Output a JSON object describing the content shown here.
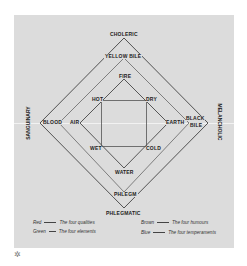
{
  "diagram": {
    "temperaments": {
      "top": "CHOLERIC",
      "left": "SANGUINARY",
      "right": "MELANCHOLIC",
      "bottom": "PHLEGMATIC"
    },
    "humours": {
      "top": "YELLOW BILE",
      "left": "BLOOD",
      "right_line1": "BLACK",
      "right_line2": "BILE",
      "bottom": "PHLEGM"
    },
    "elements": {
      "top": "FIRE",
      "left": "AIR",
      "right": "EARTH",
      "bottom": "WATER"
    },
    "qualities": {
      "top_left": "HOT",
      "top_right": "DRY",
      "bottom_left": "WET",
      "bottom_right": "COLD"
    },
    "colors": {
      "panel": "#dcdcdc",
      "lines": "#333333",
      "text": "#222222"
    }
  },
  "legend": {
    "items": [
      {
        "key": "Red",
        "desc": "The four qualities"
      },
      {
        "key": "Green",
        "desc": "The four elements"
      },
      {
        "key": "Brown",
        "desc": "The four humours"
      },
      {
        "key": "Blue",
        "desc": "The four temperaments"
      }
    ]
  },
  "footer": {
    "symbol": "✲"
  }
}
